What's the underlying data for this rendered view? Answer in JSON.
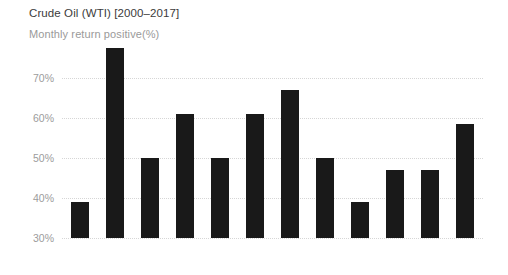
{
  "chart_data": {
    "type": "bar",
    "title": "Crude Oil (WTI) [2000–2017]",
    "subtitle": "Monthly return positive(%)",
    "xlabel": "",
    "ylabel": "",
    "ylim": [
      30,
      80
    ],
    "y_ticks": [
      30,
      40,
      50,
      60,
      70
    ],
    "y_tick_labels": [
      "30%",
      "40%",
      "50%",
      "60%",
      "70%"
    ],
    "grid": true,
    "legend": "none",
    "bar_color": "#191919",
    "grid_color": "#d6d6d6",
    "text_color": "#3b3b3b",
    "muted_text_color": "#9c9c9c",
    "categories": [
      "Jan",
      "Feb",
      "Mar",
      "Apr",
      "May",
      "Jun",
      "Jul",
      "Aug",
      "Sep",
      "Oct",
      "Nov",
      "Dec"
    ],
    "values": [
      39,
      77.5,
      50,
      61,
      50,
      61,
      67,
      50,
      39,
      47,
      47,
      58.5
    ],
    "value_labels": [
      "39%",
      "77.5%",
      "50%",
      "61%",
      "50%",
      "61%",
      "67%",
      "50%",
      "39%",
      "47%",
      "47%",
      "58.5%"
    ]
  }
}
